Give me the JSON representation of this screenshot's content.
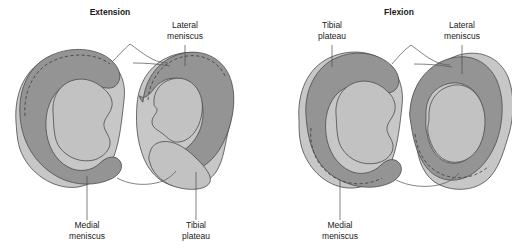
{
  "figure": {
    "background_color": "#ffffff"
  },
  "colors": {
    "plateau_base": "#c7c7c7",
    "meniscus": "#949494",
    "articular_surface": "#c2c2c2",
    "outline": "#4a4a4a",
    "dashed_line": "#3a3a3a",
    "text": "#1a1a1a",
    "leader_line": "#4a4a4a"
  },
  "panels": [
    {
      "id": "extension",
      "title": "Extension",
      "title_x": 110,
      "title_y": 15,
      "annotations": [
        {
          "name": "lateral-meniscus",
          "lines": [
            "Lateral",
            "meniscus"
          ],
          "text_x": 185,
          "text_y": 28,
          "leader": "M185,46 L185,65"
        },
        {
          "name": "medial-meniscus",
          "lines": [
            "Medial",
            "meniscus"
          ],
          "text_x": 87,
          "text_y": 225,
          "leader": "M87,218 L87,176"
        },
        {
          "name": "tibial-plateau",
          "lines": [
            "Tibial",
            "plateau"
          ],
          "text_x": 196,
          "text_y": 225,
          "leader": "M196,218 L196,172"
        }
      ]
    },
    {
      "id": "flexion",
      "title": "Flexion",
      "title_x": 399,
      "title_y": 15,
      "annotations": [
        {
          "name": "tibial-plateau",
          "lines": [
            "Tibial",
            "plateau"
          ],
          "text_x": 332,
          "text_y": 28,
          "leader": "M332,46 L332,66"
        },
        {
          "name": "lateral-meniscus",
          "lines": [
            "Lateral",
            "meniscus"
          ],
          "text_x": 462,
          "text_y": 28,
          "leader": "M462,46 L462,72"
        },
        {
          "name": "medial-meniscus",
          "lines": [
            "Medial",
            "meniscus"
          ],
          "text_x": 340,
          "text_y": 225,
          "leader": "M340,218 L340,180"
        }
      ]
    }
  ],
  "legend_labels": {
    "lateral_meniscus": "Lateral meniscus",
    "medial_meniscus": "Medial meniscus",
    "tibial_plateau": "Tibial plateau",
    "extension": "Extension",
    "flexion": "Flexion"
  }
}
